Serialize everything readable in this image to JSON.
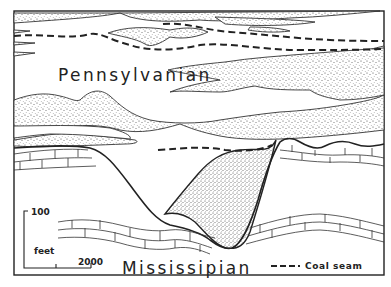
{
  "diagram": {
    "type": "geologic-cross-section",
    "labels": {
      "upper_unit": "Pennsylvanian",
      "lower_unit": "Mississipian"
    },
    "scale_bar": {
      "vertical_value": "100",
      "unit": "feet",
      "horizontal_value": "2000"
    },
    "legend": {
      "coal_seam_label": "Coal seam",
      "coal_seam_symbol": "dashed-line"
    },
    "patterns": {
      "sandstone": "stippled",
      "limestone": "brick"
    },
    "colors": {
      "ink": "#222222",
      "paper": "#ffffff"
    }
  }
}
